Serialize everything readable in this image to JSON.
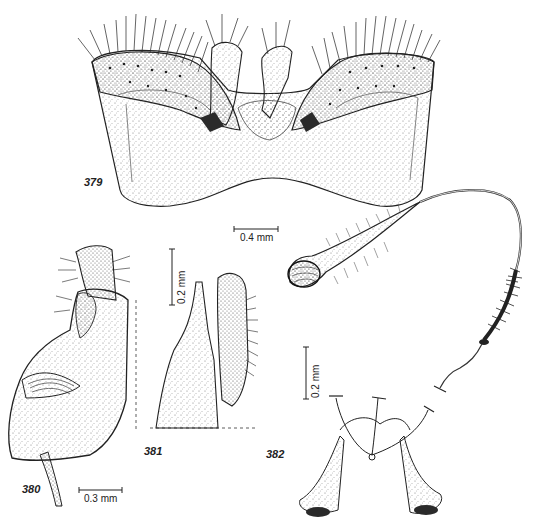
{
  "plate": {
    "background": "#ffffff",
    "ink": "#1a1a1a",
    "stipple": "#555555"
  },
  "figures": [
    {
      "id": "379",
      "label": "379",
      "description": "hypandrium / genital plate, ventral view, with two setose lobes and central parameres",
      "scale_bar": {
        "label": "0.4 mm",
        "orientation": "horizontal"
      }
    },
    {
      "id": "380",
      "label": "380",
      "description": "gonocoxite and gonostylus, lateral view",
      "scale_bar": {
        "label": "0.3 mm",
        "orientation": "horizontal"
      }
    },
    {
      "id": "381",
      "label": "381",
      "description": "paramere and aedeagal apex, lateral view",
      "scale_bar": {
        "label": "0.2 mm",
        "orientation": "vertical"
      }
    },
    {
      "id": "382",
      "label": "382",
      "description": "spermatheca with setose bulb, coiled duct and furca",
      "scale_bar": {
        "label": "0.2 mm",
        "orientation": "vertical"
      }
    }
  ]
}
